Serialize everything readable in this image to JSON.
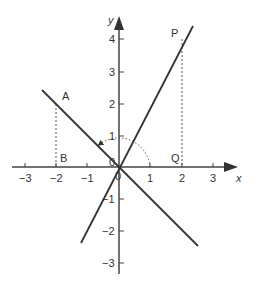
{
  "figure": {
    "axes": {
      "x_label": "x",
      "y_label": "y",
      "x_ticks": [
        {
          "value": -3,
          "label": "−3"
        },
        {
          "value": -2,
          "label": "−2"
        },
        {
          "value": -1,
          "label": "−1"
        },
        {
          "value": 1,
          "label": "1"
        },
        {
          "value": 2,
          "label": "2"
        },
        {
          "value": 3,
          "label": "3"
        }
      ],
      "y_ticks": [
        {
          "value": 4,
          "label": "4"
        },
        {
          "value": 3,
          "label": "3"
        },
        {
          "value": 2,
          "label": "2"
        },
        {
          "value": 1,
          "label": "1"
        },
        {
          "value": -1,
          "label": "−1"
        },
        {
          "value": -2,
          "label": "−2"
        },
        {
          "value": -3,
          "label": "−3"
        }
      ],
      "origin_labels": [
        "0",
        "0"
      ]
    },
    "lines": [
      {
        "name": "line-y-equals-2x",
        "equation": "y = 2x",
        "from": [
          -1.2,
          -2.4
        ],
        "to": [
          2.35,
          4.3
        ]
      },
      {
        "name": "line-y-equals-neg-x",
        "equation": "y = -x",
        "from": [
          -2.45,
          2.45
        ],
        "to": [
          2.5,
          -2.5
        ]
      }
    ],
    "points": [
      {
        "label": "A",
        "x": -2,
        "y": 2
      },
      {
        "label": "B",
        "x": -2,
        "y": 0
      },
      {
        "label": "P",
        "x": 2,
        "y": 4
      },
      {
        "label": "Q",
        "x": 2,
        "y": 0
      }
    ],
    "rotation_arc": {
      "radius": 1,
      "from_angle_deg": 0,
      "to_angle_deg": 135,
      "style": "dotted",
      "arrow": true
    },
    "colors": {
      "line": "#333333",
      "text": "#333333",
      "background": "#ffffff"
    }
  }
}
